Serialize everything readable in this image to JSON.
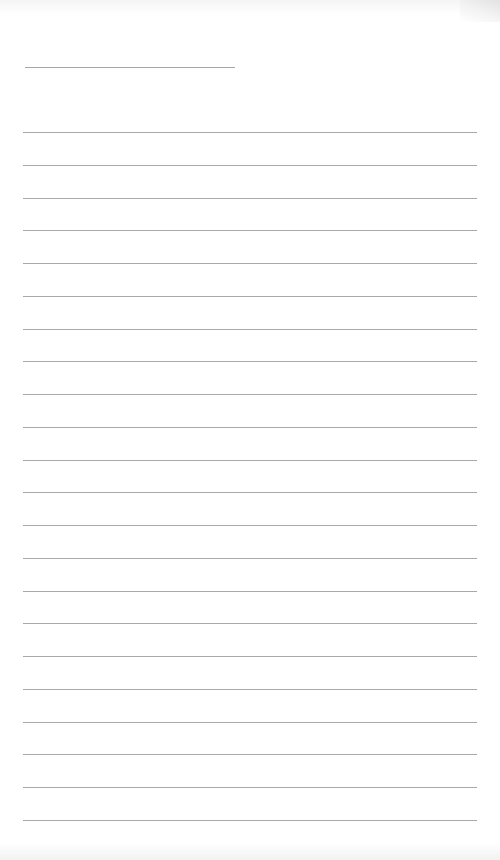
{
  "sheet": {
    "type": "lined-paper",
    "name_line": {
      "top": 67,
      "left": 25,
      "width": 210
    },
    "rules": {
      "count": 22,
      "first_top": 132,
      "spacing": 32.75,
      "left": 23,
      "width": 454
    },
    "line_color": "#a9a9a9",
    "background": "#ffffff"
  }
}
